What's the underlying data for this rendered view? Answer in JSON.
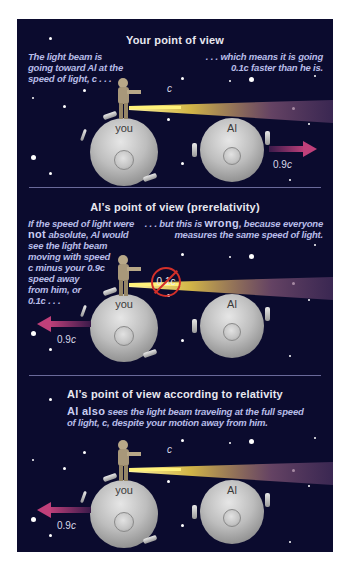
{
  "colors": {
    "panel_bg": "#0b0b2e",
    "caption_text": "#b8bde8",
    "title_text": "#e8e8f0",
    "beam": "#f5e04a",
    "velocity_arrow": "#b0306a",
    "forbidden_mark": "#d2302a",
    "divider": "#6a6a9a"
  },
  "sections": [
    {
      "title": "Your point of view",
      "caption_left": "The light beam is going toward Al at the speed of light, c . . .",
      "caption_right_line1": ". . . which means it is going",
      "caption_right_line2": "0.1c faster than he is.",
      "beam_label": "c",
      "you_label": "you",
      "al_label": "Al",
      "arrow_label": "0.9",
      "arrow_label_unit": "c",
      "arrow_direction": "right (Al moving away)"
    },
    {
      "title": "Al’s point of view (prerelativity)",
      "caption_left_em": "not",
      "caption_left_l1": "If the speed of light were",
      "caption_left_l2": " absolute, Al would",
      "caption_left_l3": "see the light beam",
      "caption_left_l4": "moving with speed",
      "caption_left_l5": "c minus your 0.9c",
      "caption_left_l6": "speed away",
      "caption_left_l7": "from him, or",
      "caption_left_l8": "0.1c . . .",
      "caption_right_pre": ". . . but this is ",
      "caption_right_em": "wrong",
      "caption_right_post": ", because everyone",
      "caption_right_line2": "measures the same speed of light.",
      "crossed_label": "0.1c",
      "you_label": "you",
      "al_label": "Al",
      "arrow_label": "0.9",
      "arrow_label_unit": "c",
      "arrow_direction": "left (you moving away)"
    },
    {
      "title": "Al’s point of view according to relativity",
      "caption_em": "Al also",
      "caption_l1_rest": " sees the light beam traveling at the full speed",
      "caption_l2": "of light, c, despite your motion away from him.",
      "beam_label": "c",
      "you_label": "you",
      "al_label": "Al",
      "arrow_label": "0.9",
      "arrow_label_unit": "c",
      "arrow_direction": "left (you moving away)"
    }
  ]
}
